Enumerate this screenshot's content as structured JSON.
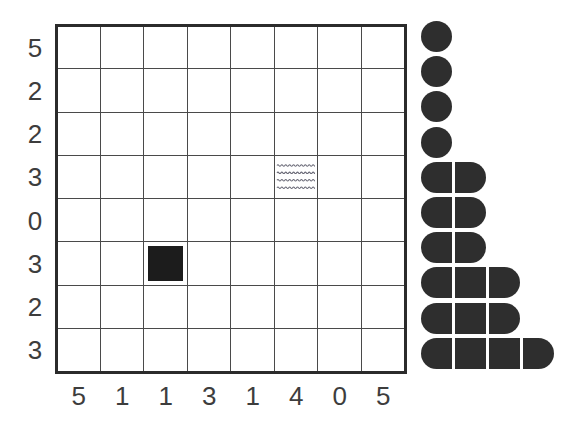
{
  "figure": {
    "type": "grid-with-blob-cluster",
    "background_color": "#ffffff",
    "grid_line_color": "#4a4a4a",
    "frame_color": "#2b2b2b",
    "marker_color": "#1c1c1c",
    "blob_color": "#2e2e2e",
    "label_color": "#3d3d3d"
  },
  "chart_data": {
    "type": "heatmap",
    "title": "",
    "xlabel": "",
    "ylabel": "",
    "rows": 8,
    "cols": 8,
    "x_tick_labels": [
      "5",
      "1",
      "1",
      "3",
      "1",
      "4",
      "0",
      "5"
    ],
    "y_tick_labels": [
      "5",
      "2",
      "2",
      "3",
      "0",
      "3",
      "2",
      "3"
    ],
    "grid": true,
    "legend": "none",
    "markers": [
      {
        "name": "solid-square",
        "row": 5,
        "col": 2,
        "fill": "solid",
        "color": "#1c1c1c"
      },
      {
        "name": "wavy-water",
        "row": 3,
        "col": 5,
        "fill": "wavy-lines",
        "color": "#6b6b78",
        "wave_count": 4
      }
    ],
    "blob_cluster": {
      "name": "segmented-bar-stack",
      "description": "Left-aligned stack of rounded segment bars, one row per unit count",
      "segment_size_px": 31,
      "row_counts": [
        1,
        1,
        1,
        1,
        2,
        2,
        2,
        3,
        3,
        4
      ],
      "total_segments": 20
    }
  },
  "grid_cells": [
    [
      "",
      "",
      "",
      "",
      "",
      "",
      "",
      ""
    ],
    [
      "",
      "",
      "",
      "",
      "",
      "",
      "",
      ""
    ],
    [
      "",
      "",
      "",
      "",
      "",
      "",
      "",
      ""
    ],
    [
      "",
      "",
      "",
      "",
      "",
      "",
      "",
      ""
    ],
    [
      "",
      "",
      "",
      "",
      "",
      "",
      "",
      ""
    ],
    [
      "",
      "",
      "",
      "",
      "",
      "",
      "",
      ""
    ],
    [
      "",
      "",
      "",
      "",
      "",
      "",
      "",
      ""
    ],
    [
      "",
      "",
      "",
      "",
      "",
      "",
      "",
      ""
    ]
  ]
}
